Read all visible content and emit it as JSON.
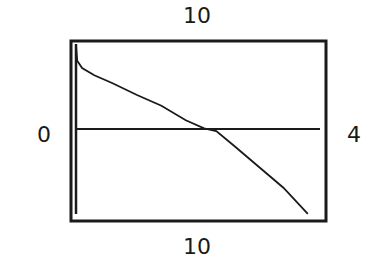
{
  "chart_data": {
    "type": "line",
    "title": "",
    "xlabel": "",
    "ylabel": "",
    "window_labels": {
      "top": "10",
      "left": "0",
      "right": "4",
      "bottom": "10"
    },
    "xlim": [
      0,
      4
    ],
    "ylim": [
      -10,
      10
    ],
    "grid": false,
    "legend": null,
    "series": [
      {
        "name": "f(x)",
        "x": [
          0.0,
          0.02,
          0.1,
          0.3,
          0.6,
          1.0,
          1.4,
          1.8,
          2.1,
          2.3,
          2.6,
          3.0,
          3.4,
          3.8
        ],
        "y": [
          9.5,
          7.8,
          7.0,
          6.2,
          5.3,
          4.0,
          2.8,
          1.2,
          0.3,
          0.0,
          -1.7,
          -4.0,
          -6.3,
          -9.2
        ]
      }
    ],
    "colors": {
      "line": "#1a1a1a",
      "frame": "#1a1a1a",
      "background": "#ffffff"
    }
  }
}
